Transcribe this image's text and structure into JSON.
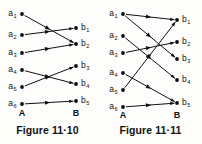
{
  "page": {
    "background": "#fdfdfc",
    "ink": "#111111"
  },
  "figures": [
    {
      "id": "figure-11-10",
      "caption": "Figure 11·10",
      "caption_number": "11·10",
      "set_labels": {
        "left": "A",
        "right": "B"
      },
      "left_nodes": [
        {
          "id": "a1",
          "base": "a",
          "sub": "1",
          "x": 22,
          "y": 14
        },
        {
          "id": "a2",
          "base": "a",
          "sub": "2",
          "x": 22,
          "y": 35
        },
        {
          "id": "a3",
          "base": "a",
          "sub": "3",
          "x": 22,
          "y": 53
        },
        {
          "id": "a4",
          "base": "a",
          "sub": "4",
          "x": 22,
          "y": 70
        },
        {
          "id": "a5",
          "base": "a",
          "sub": "5",
          "x": 22,
          "y": 87
        },
        {
          "id": "a6",
          "base": "a",
          "sub": "6",
          "x": 22,
          "y": 104
        }
      ],
      "right_nodes": [
        {
          "id": "b1",
          "base": "b",
          "sub": "1",
          "x": 76,
          "y": 28
        },
        {
          "id": "b2",
          "base": "b",
          "sub": "2",
          "x": 76,
          "y": 44
        },
        {
          "id": "b3",
          "base": "b",
          "sub": "3",
          "x": 76,
          "y": 66
        },
        {
          "id": "b4",
          "base": "b",
          "sub": "4",
          "x": 76,
          "y": 84
        },
        {
          "id": "b5",
          "base": "b",
          "sub": "5",
          "x": 76,
          "y": 101
        }
      ],
      "edges": [
        {
          "from": "a1",
          "to": "b2"
        },
        {
          "from": "a2",
          "to": "b1"
        },
        {
          "from": "a3",
          "to": "b2"
        },
        {
          "from": "a4",
          "to": "b4"
        },
        {
          "from": "a5",
          "to": "b3"
        },
        {
          "from": "a6",
          "to": "b5"
        }
      ]
    },
    {
      "id": "figure-11-11",
      "caption": "Figure 11·11",
      "caption_number": "11·11",
      "set_labels": {
        "left": "A",
        "right": "B"
      },
      "left_nodes": [
        {
          "id": "a1",
          "base": "a",
          "sub": "1",
          "x": 22,
          "y": 14
        },
        {
          "id": "a2",
          "base": "a",
          "sub": "2",
          "x": 22,
          "y": 36
        },
        {
          "id": "a3",
          "base": "a",
          "sub": "3",
          "x": 22,
          "y": 53
        },
        {
          "id": "a4",
          "base": "a",
          "sub": "4",
          "x": 22,
          "y": 73
        },
        {
          "id": "a5",
          "base": "a",
          "sub": "5",
          "x": 22,
          "y": 90
        },
        {
          "id": "a6",
          "base": "a",
          "sub": "6",
          "x": 22,
          "y": 107
        }
      ],
      "right_nodes": [
        {
          "id": "b1",
          "base": "b",
          "sub": "1",
          "x": 76,
          "y": 20
        },
        {
          "id": "b2",
          "base": "b",
          "sub": "2",
          "x": 76,
          "y": 42
        },
        {
          "id": "b3",
          "base": "b",
          "sub": "3",
          "x": 76,
          "y": 59
        },
        {
          "id": "b4",
          "base": "b",
          "sub": "4",
          "x": 76,
          "y": 80
        },
        {
          "id": "b5",
          "base": "b",
          "sub": "5",
          "x": 76,
          "y": 103
        }
      ],
      "edges": [
        {
          "from": "a1",
          "to": "b1"
        },
        {
          "from": "a1",
          "to": "b3"
        },
        {
          "from": "a2",
          "to": "b4"
        },
        {
          "from": "a3",
          "to": "b2"
        },
        {
          "from": "a4",
          "to": "b5"
        },
        {
          "from": "a5",
          "to": "b1"
        },
        {
          "from": "a6",
          "to": "b5"
        }
      ]
    }
  ]
}
